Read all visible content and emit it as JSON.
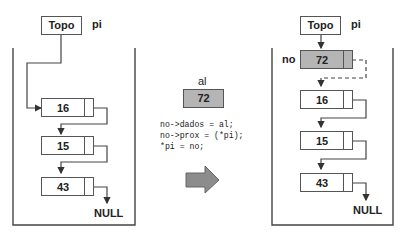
{
  "before": {
    "topo_label": "Topo",
    "pi_label": "pi",
    "nodes": [
      {
        "value": "16"
      },
      {
        "value": "15"
      },
      {
        "value": "43"
      }
    ],
    "null_label": "NULL"
  },
  "middle": {
    "var_label": "al",
    "var_value": "72",
    "code_lines": [
      "no->dados = al;",
      "no->prox = (*pi);",
      "*pi = no;"
    ],
    "arrow_icon": "right-arrow-icon"
  },
  "after": {
    "topo_label": "Topo",
    "pi_label": "pi",
    "new_node_label": "no",
    "nodes": [
      {
        "value": "72"
      },
      {
        "value": "16"
      },
      {
        "value": "15"
      },
      {
        "value": "43"
      }
    ],
    "null_label": "NULL"
  },
  "colors": {
    "line": "#555555",
    "highlight": "#b5b5b5",
    "arrow_fill": "#8c8c8c"
  }
}
